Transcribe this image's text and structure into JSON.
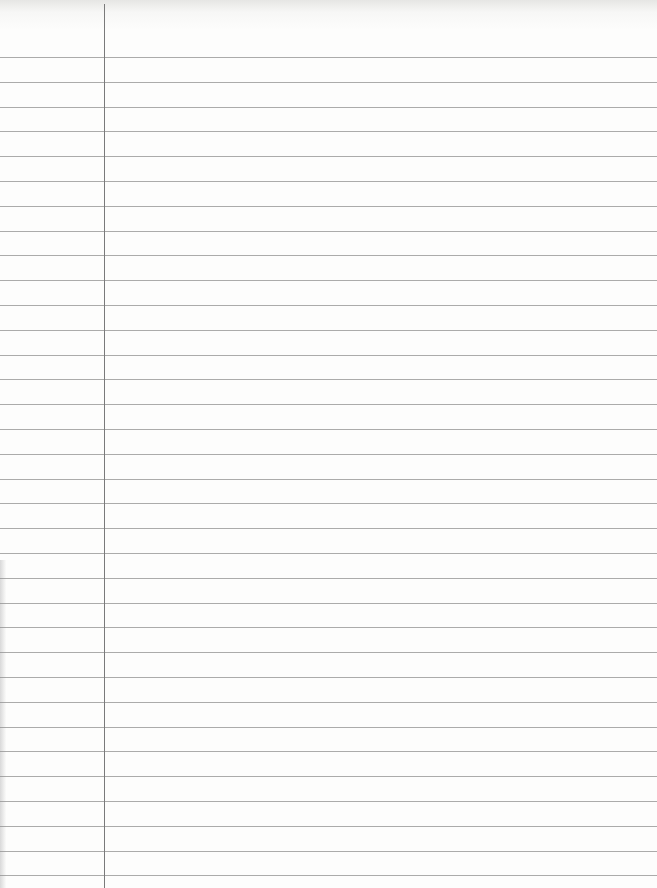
{
  "paper": {
    "type": "lined notebook page",
    "background": "#fbfbfa",
    "line_color": "#8f8f8f",
    "margin_line_color": "#7a7a7a",
    "margin_x": 104,
    "first_line_y": 57,
    "line_spacing": 24.8,
    "line_count": 34,
    "text": ""
  }
}
